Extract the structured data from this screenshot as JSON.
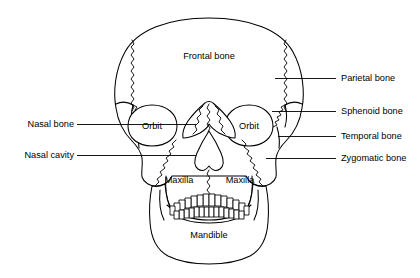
{
  "figure": {
    "background_color": "#ffffff",
    "line_color": "#000000",
    "text_color": "#000000",
    "width": 420,
    "height": 278
  },
  "internal_labels": [
    {
      "id": "frontal-bone",
      "text": "Frontal bone",
      "x": 209,
      "y": 59,
      "anchor": "middle"
    },
    {
      "id": "orbit-left",
      "text": "Orbit",
      "x": 152,
      "y": 127,
      "anchor": "middle"
    },
    {
      "id": "orbit-right",
      "text": "Orbit",
      "x": 249,
      "y": 127,
      "anchor": "middle"
    },
    {
      "id": "maxilla-left",
      "text": "Maxilla",
      "x": 179,
      "y": 183,
      "anchor": "middle"
    },
    {
      "id": "maxilla-right",
      "text": "Maxilla",
      "x": 233,
      "y": 183,
      "anchor": "middle"
    },
    {
      "id": "mandible",
      "text": "Mandible",
      "x": 209,
      "y": 238,
      "anchor": "middle"
    }
  ],
  "callouts_left": [
    {
      "id": "nasal-bone",
      "text": "Nasal bone",
      "text_x": 72,
      "text_y": 127,
      "anchor": "end",
      "line_x1": 77,
      "line_x2": 196,
      "line_y": 124
    },
    {
      "id": "nasal-cavity",
      "text": "Nasal cavity",
      "text_x": 72,
      "text_y": 158,
      "anchor": "end",
      "line_x1": 77,
      "line_x2": 196,
      "line_y": 155
    }
  ],
  "callouts_right": [
    {
      "id": "parietal-bone",
      "text": "Parietal bone",
      "text_x": 341,
      "text_y": 81,
      "anchor": "start",
      "line_x1": 275,
      "line_x2": 336,
      "line_y": 78
    },
    {
      "id": "sphenoid-bone",
      "text": "Sphenoid bone",
      "text_x": 341,
      "text_y": 114,
      "anchor": "start",
      "line_x1": 272,
      "line_x2": 336,
      "line_y": 111
    },
    {
      "id": "temporal-bone",
      "text": "Temporal bone",
      "text_x": 341,
      "text_y": 139,
      "anchor": "start",
      "line_x1": 278,
      "line_x2": 336,
      "line_y": 136
    },
    {
      "id": "zygomatic-bone",
      "text": "Zygomatic bone",
      "text_x": 341,
      "text_y": 161,
      "anchor": "start",
      "line_x1": 266,
      "line_x2": 336,
      "line_y": 158
    }
  ],
  "upper_teeth_count": 14,
  "lower_teeth_count": 14
}
